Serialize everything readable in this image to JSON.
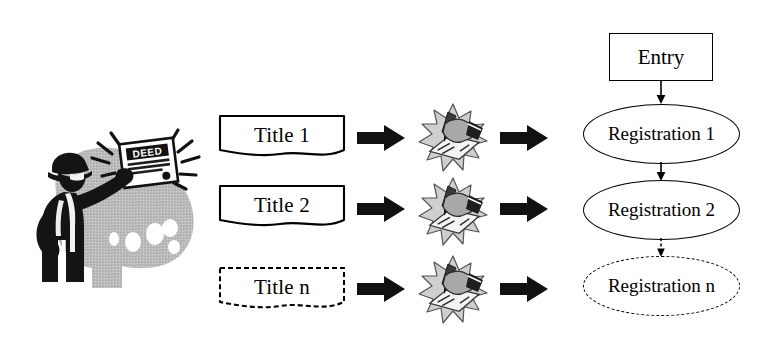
{
  "diagram": {
    "title_column": {
      "items": [
        {
          "label": "Title 1",
          "border": "solid"
        },
        {
          "label": "Title 2",
          "border": "solid"
        },
        {
          "label": "Title n",
          "border": "dashed"
        }
      ]
    },
    "process_icons": [
      {
        "name": "hand-signing-document-icon"
      },
      {
        "name": "hand-signing-document-icon"
      },
      {
        "name": "hand-signing-document-icon"
      }
    ],
    "arrows_left": [
      {
        "name": "block-arrow-right"
      },
      {
        "name": "block-arrow-right"
      },
      {
        "name": "block-arrow-right"
      }
    ],
    "arrows_right": [
      {
        "name": "block-arrow-right"
      },
      {
        "name": "block-arrow-right"
      },
      {
        "name": "block-arrow-right"
      }
    ],
    "registry_column": {
      "entry": {
        "label": "Entry",
        "shape": "rectangle",
        "border": "solid"
      },
      "ovals": [
        {
          "label": "Registration 1",
          "shape": "ellipse",
          "border": "solid"
        },
        {
          "label": "Registration 2",
          "shape": "ellipse",
          "border": "solid"
        },
        {
          "label": "Registration n",
          "shape": "ellipse",
          "border": "dashed"
        }
      ],
      "connectors": [
        {
          "from": "Entry",
          "to": "Registration 1",
          "style": "solid"
        },
        {
          "from": "Registration 1",
          "to": "Registration 2",
          "style": "solid"
        },
        {
          "from": "Registration 2",
          "to": "Registration n",
          "style": "dashed"
        }
      ]
    },
    "illustration": {
      "name": "man-holding-deed-clipart",
      "document_label": "DEED",
      "colors": {
        "ink": "#1a1a1a",
        "blob": "#b9b9b9",
        "paper": "#ffffff"
      }
    },
    "colors": {
      "line": "#000000",
      "arrow_fill": "#111111",
      "background": "#ffffff",
      "gray_mid": "#9a9a9a",
      "gray_light": "#d2d2d2"
    }
  }
}
